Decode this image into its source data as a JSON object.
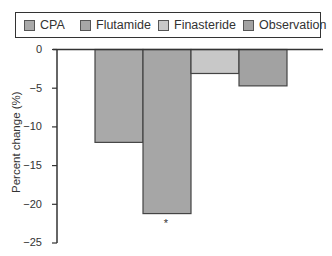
{
  "chart_data": {
    "type": "bar",
    "title": "",
    "xlabel": "",
    "ylabel": "Percent change (%)",
    "ylim": [
      -25,
      0
    ],
    "yticks": [
      0,
      -5,
      -10,
      -15,
      -20,
      -25
    ],
    "ytick_labels": [
      "0",
      "−5",
      "−10",
      "−15",
      "−20",
      "−25"
    ],
    "grid": false,
    "legend_position": "top",
    "categories": [
      "CPA",
      "Flutamide",
      "Finasteride",
      "Observation"
    ],
    "values": [
      -12.0,
      -21.2,
      -3.1,
      -4.7
    ],
    "colors": [
      "#a9a9a9",
      "#a6a6a6",
      "#c8c8c8",
      "#a2a2a2"
    ],
    "annotations": [
      {
        "category": "Flutamide",
        "text": "*"
      }
    ]
  },
  "legend": {
    "items": [
      {
        "label": "CPA",
        "color": "#a9a9a9"
      },
      {
        "label": "Flutamide",
        "color": "#a6a6a6"
      },
      {
        "label": "Finasteride",
        "color": "#c8c8c8"
      },
      {
        "label": "Observation",
        "color": "#a2a2a2"
      }
    ]
  }
}
